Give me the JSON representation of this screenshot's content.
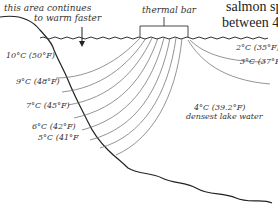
{
  "annotations": {
    "warm_area_line1": "this area continues",
    "warm_area_line2": "to warm faster",
    "thermal_bar": "thermal bar",
    "densest": "4°C (39.2°F)",
    "densest_sub": "densest lake water"
  },
  "body_text": {
    "line1": "salmon spe",
    "line2": "between 4"
  },
  "isotherms_left": [
    {
      "label": "10°C (50°F)"
    },
    {
      "label": "9°C (48°F)"
    },
    {
      "label": "7°C (45°F)"
    },
    {
      "label": "6°C (42°F)"
    },
    {
      "label": "5°C (41°F"
    }
  ],
  "isotherms_right": [
    {
      "label": "2°C (35°F)"
    },
    {
      "label": "3°C (37°F)"
    }
  ],
  "colors": {
    "line": "#555555",
    "shore": "#222222",
    "text": "#333333"
  }
}
